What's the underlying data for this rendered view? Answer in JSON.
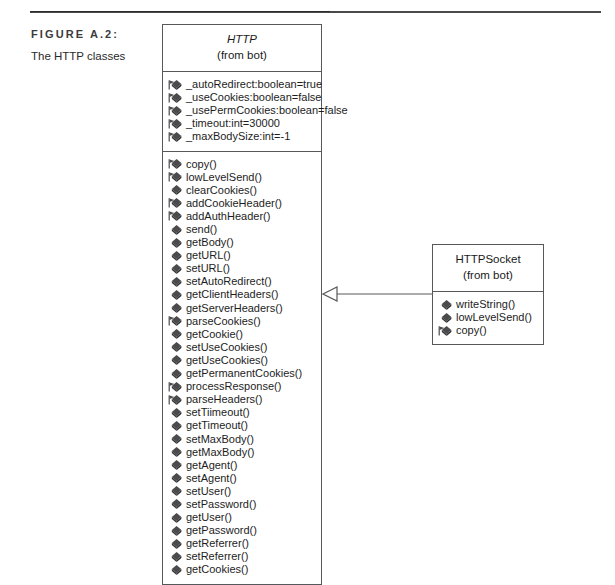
{
  "figure": {
    "label": "FIGURE A.2:",
    "title": "The HTTP classes"
  },
  "colors": {
    "line": "#58585a",
    "icon_fill": "#4b4b4d",
    "text": "#1d1d1d",
    "rule": "#4a4a4a"
  },
  "diagram": {
    "type": "uml-class-diagram",
    "relationship": {
      "kind": "generalization",
      "from": "HTTPSocket",
      "to": "HTTP",
      "arrowhead": "hollow-triangle"
    },
    "classes": [
      {
        "id": "http",
        "name": "HTTP",
        "abstract": true,
        "package": "(from bot)",
        "attributes": [
          {
            "visibility": "protected",
            "text": "_autoRedirect:boolean=true"
          },
          {
            "visibility": "protected",
            "text": "_useCookies:boolean=false"
          },
          {
            "visibility": "protected",
            "text": "_usePermCookies:boolean=false"
          },
          {
            "visibility": "protected",
            "text": "_timeout:int=30000"
          },
          {
            "visibility": "protected",
            "text": "_maxBodySize:int=-1"
          }
        ],
        "operations": [
          {
            "visibility": "protected",
            "text": "copy()"
          },
          {
            "visibility": "protected",
            "text": "lowLevelSend()"
          },
          {
            "visibility": "public",
            "text": "clearCookies()"
          },
          {
            "visibility": "protected",
            "text": "addCookieHeader()"
          },
          {
            "visibility": "protected",
            "text": "addAuthHeader()"
          },
          {
            "visibility": "public",
            "text": "send()"
          },
          {
            "visibility": "public",
            "text": "getBody()"
          },
          {
            "visibility": "public",
            "text": "getURL()"
          },
          {
            "visibility": "public",
            "text": "setURL()"
          },
          {
            "visibility": "public",
            "text": "setAutoRedirect()"
          },
          {
            "visibility": "public",
            "text": "getClientHeaders()"
          },
          {
            "visibility": "public",
            "text": "getServerHeaders()"
          },
          {
            "visibility": "protected",
            "text": "parseCookies()"
          },
          {
            "visibility": "public",
            "text": "getCookie()"
          },
          {
            "visibility": "public",
            "text": "setUseCookies()"
          },
          {
            "visibility": "public",
            "text": "getUseCookies()"
          },
          {
            "visibility": "public",
            "text": "getPermanentCookies()"
          },
          {
            "visibility": "protected",
            "text": "processResponse()"
          },
          {
            "visibility": "protected",
            "text": "parseHeaders()"
          },
          {
            "visibility": "public",
            "text": "setTiimeout()"
          },
          {
            "visibility": "public",
            "text": "getTimeout()"
          },
          {
            "visibility": "public",
            "text": "setMaxBody()"
          },
          {
            "visibility": "public",
            "text": "getMaxBody()"
          },
          {
            "visibility": "public",
            "text": "getAgent()"
          },
          {
            "visibility": "public",
            "text": "setAgent()"
          },
          {
            "visibility": "public",
            "text": "setUser()"
          },
          {
            "visibility": "public",
            "text": "setPassword()"
          },
          {
            "visibility": "public",
            "text": "getUser()"
          },
          {
            "visibility": "public",
            "text": "getPassword()"
          },
          {
            "visibility": "public",
            "text": "getReferrer()"
          },
          {
            "visibility": "public",
            "text": "setReferrer()"
          },
          {
            "visibility": "public",
            "text": "getCookies()"
          }
        ]
      },
      {
        "id": "httpsocket",
        "name": "HTTPSocket",
        "abstract": false,
        "package": "(from bot)",
        "attributes": [],
        "operations": [
          {
            "visibility": "public",
            "text": "writeString()"
          },
          {
            "visibility": "public",
            "text": "lowLevelSend()"
          },
          {
            "visibility": "protected",
            "text": "copy()"
          }
        ]
      }
    ]
  }
}
